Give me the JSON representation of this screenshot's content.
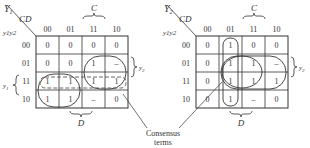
{
  "maps": [
    {
      "corner_top": "Y",
      "corner_top_sub": "1",
      "col_var": "CD",
      "row_var": "y1y2",
      "col_headers": [
        "00",
        "01",
        "11",
        "10"
      ],
      "row_headers": [
        "00",
        "01",
        "11",
        "10"
      ],
      "cells": [
        [
          "0",
          "0",
          "0",
          "0"
        ],
        [
          "0",
          "0",
          "1",
          "–"
        ],
        [
          "1",
          "1",
          "1",
          "1"
        ],
        [
          "1",
          "1",
          "–",
          "0"
        ]
      ],
      "label_C": "C",
      "label_D": "D",
      "label_y1": "y1",
      "label_y2": "y2"
    },
    {
      "corner_top": "Y",
      "corner_top_sub": "2",
      "col_var": "CD",
      "row_var": "y1y2",
      "col_headers": [
        "00",
        "01",
        "11",
        "10"
      ],
      "row_headers": [
        "00",
        "01",
        "11",
        "10"
      ],
      "cells": [
        [
          "0",
          "1",
          "0",
          "0"
        ],
        [
          "0",
          "1",
          "1",
          "–"
        ],
        [
          "0",
          "1",
          "1",
          "1"
        ],
        [
          "0",
          "1",
          "–",
          "0"
        ]
      ],
      "label_C": "C",
      "label_D": "D",
      "label_y2": "y2"
    }
  ],
  "annotation": {
    "line1": "Consensus",
    "line2": "terms"
  }
}
